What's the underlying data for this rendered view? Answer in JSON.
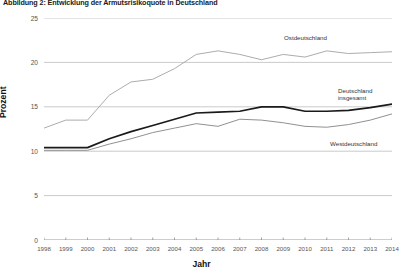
{
  "figure": {
    "title": "Abbildung 2: Entwicklung der Armutsrisikoquote in Deutschland"
  },
  "axes": {
    "ylabel": "Prozent",
    "xlabel": "Jahr"
  },
  "series_labels": {
    "ost": "Ostdeutschland",
    "gesamt_line1": "Deutschland",
    "gesamt_line2": "insgesamt",
    "west": "Westdeutschland"
  },
  "colors": {
    "ost": "#a8a8a8",
    "gesamt": "#1a1a1a",
    "west": "#8a8a8a",
    "grid": "#bdbdbd",
    "axis": "#8f8f8f"
  },
  "chart_data": {
    "type": "line",
    "title": "Abbildung 2: Entwicklung der Armutsrisikoquote in Deutschland",
    "xlabel": "Jahr",
    "ylabel": "Prozent",
    "ylim": [
      0,
      25
    ],
    "yticks": [
      0,
      5,
      10,
      15,
      20,
      25
    ],
    "grid": true,
    "legend": "inline-right",
    "x": [
      1998,
      1999,
      2000,
      2001,
      2002,
      2003,
      2004,
      2005,
      2006,
      2007,
      2008,
      2009,
      2010,
      2011,
      2012,
      2013,
      2014
    ],
    "categories": [
      "1998",
      "1999",
      "2000",
      "2001",
      "2002",
      "2003",
      "2004",
      "2005",
      "2006",
      "2007",
      "2008",
      "2009",
      "2010",
      "2011",
      "2012",
      "2013",
      "2014"
    ],
    "series": [
      {
        "name": "Ostdeutschland",
        "color": "#a8a8a8",
        "values": [
          12.6,
          13.5,
          13.5,
          16.3,
          17.8,
          18.1,
          19.3,
          20.9,
          21.3,
          20.9,
          20.3,
          20.9,
          20.6,
          21.3,
          21.0,
          21.1,
          21.2
        ]
      },
      {
        "name": "Deutschland insgesamt",
        "color": "#1a1a1a",
        "values": [
          10.4,
          10.4,
          10.4,
          11.4,
          12.2,
          12.9,
          13.6,
          14.3,
          14.4,
          14.5,
          15.0,
          15.0,
          14.5,
          14.5,
          14.6,
          14.9,
          15.3
        ]
      },
      {
        "name": "Westdeutschland",
        "color": "#8a8a8a",
        "values": [
          10.1,
          10.1,
          10.1,
          10.8,
          11.4,
          12.1,
          12.6,
          13.1,
          12.8,
          13.6,
          13.5,
          13.2,
          12.8,
          12.7,
          13.0,
          13.5,
          14.2
        ]
      }
    ]
  }
}
